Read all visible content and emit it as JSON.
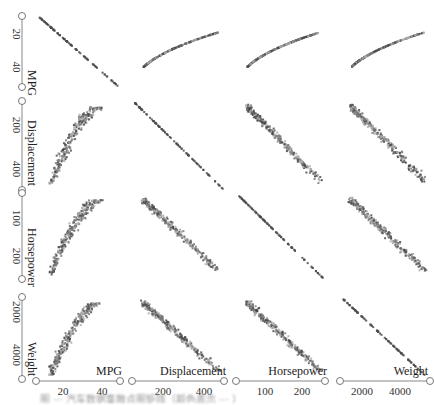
{
  "chart_data": {
    "type": "scatter",
    "subtype": "scatterplot-matrix",
    "title": "",
    "variables": [
      "MPG",
      "Displacement",
      "Horsepower",
      "Weight"
    ],
    "axes": {
      "MPG": {
        "ticks": [
          20,
          40
        ],
        "range": [
          5,
          48
        ]
      },
      "Displacement": {
        "ticks": [
          200,
          400
        ],
        "range": [
          60,
          480
        ]
      },
      "Horsepower": {
        "ticks": [
          100,
          200
        ],
        "range": [
          40,
          235
        ]
      },
      "Weight": {
        "ticks": [
          2000,
          4000
        ],
        "range": [
          1600,
          5200
        ]
      }
    },
    "vertical_axes_inverted": true,
    "point_colors": [
      "#4a4a4a",
      "#7a7a7a",
      "#a8a8a8"
    ],
    "legend": null,
    "grid": false,
    "cells": [
      [
        {
          "kind": "diagonal"
        },
        {
          "kind": "curve",
          "shape": "mpg_vs_disp"
        },
        {
          "kind": "curve",
          "shape": "mpg_vs_hp"
        },
        {
          "kind": "curve",
          "shape": "mpg_vs_wt"
        }
      ],
      [
        {
          "kind": "curve",
          "shape": "disp_vs_mpg"
        },
        {
          "kind": "diagonal"
        },
        {
          "kind": "linear",
          "shape": "disp_vs_hp"
        },
        {
          "kind": "linear",
          "shape": "disp_vs_wt"
        }
      ],
      [
        {
          "kind": "curve",
          "shape": "hp_vs_mpg"
        },
        {
          "kind": "linear",
          "shape": "hp_vs_disp"
        },
        {
          "kind": "diagonal"
        },
        {
          "kind": "linear",
          "shape": "hp_vs_wt"
        }
      ],
      [
        {
          "kind": "curve",
          "shape": "wt_vs_mpg"
        },
        {
          "kind": "linear",
          "shape": "wt_vs_disp"
        },
        {
          "kind": "linear",
          "shape": "wt_vs_hp"
        },
        {
          "kind": "diagonal"
        }
      ]
    ]
  },
  "labels": {
    "row": [
      "MPG",
      "Displacement",
      "Horsepower",
      "Weight"
    ],
    "col": [
      "MPG",
      "Displacement",
      "Horsepower",
      "Weight"
    ],
    "row_ticks": [
      [
        "20",
        "40"
      ],
      [
        "200",
        "400"
      ],
      [
        "100",
        "200"
      ],
      [
        "2000",
        "4000"
      ]
    ],
    "col_ticks": [
      [
        "20",
        "40"
      ],
      [
        "200",
        "400"
      ],
      [
        "100",
        "200"
      ],
      [
        "2000",
        "4000"
      ]
    ]
  },
  "caption": "图 ··· 汽车数据集散点图矩阵（颜色表示 ··· ）"
}
